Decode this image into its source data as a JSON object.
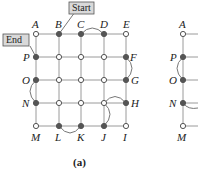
{
  "figure": {
    "caption": "(a)",
    "callouts": {
      "start": "Start",
      "end": "End"
    },
    "colors": {
      "line": "#9a9a9a",
      "filled_node": "#555555",
      "open_node": "#ffffff",
      "callout_bg": "#d9d9d9"
    },
    "nodes": [
      {
        "label": "A",
        "filled": false
      },
      {
        "label": "B",
        "filled": true
      },
      {
        "label": "C",
        "filled": true
      },
      {
        "label": "D",
        "filled": true
      },
      {
        "label": "E",
        "filled": false
      },
      {
        "label": "P",
        "filled": true
      },
      {
        "label": "F",
        "filled": true
      },
      {
        "label": "O",
        "filled": true
      },
      {
        "label": "G",
        "filled": true
      },
      {
        "label": "N",
        "filled": true
      },
      {
        "label": "H",
        "filled": true
      },
      {
        "label": "M",
        "filled": false
      },
      {
        "label": "L",
        "filled": true
      },
      {
        "label": "K",
        "filled": true
      },
      {
        "label": "J",
        "filled": true
      },
      {
        "label": "I",
        "filled": false
      }
    ],
    "arcs": [
      "C-D",
      "F-G",
      "O-N",
      "L-K",
      "H-J"
    ],
    "right_partial": {
      "labels": [
        "A",
        "P",
        "O",
        "N",
        "M"
      ],
      "arcs": [
        "P-O",
        "N-right"
      ]
    }
  }
}
